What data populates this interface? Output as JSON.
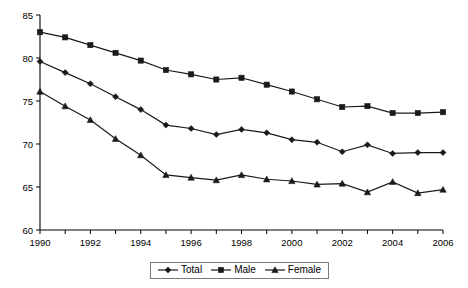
{
  "chart_data": {
    "type": "line",
    "title": "",
    "subtitle": "",
    "xlabel": "",
    "ylabel": "",
    "x": [
      1990,
      1991,
      1992,
      1993,
      1994,
      1995,
      1996,
      1997,
      1998,
      1999,
      2000,
      2001,
      2002,
      2003,
      2004,
      2005,
      2006
    ],
    "xticklabels": [
      "1990",
      "",
      "1992",
      "",
      "1994",
      "",
      "1996",
      "",
      "1998",
      "",
      "2000",
      "",
      "2002",
      "",
      "2004",
      "",
      "2006"
    ],
    "xtick_values": [
      1990,
      1991,
      1992,
      1993,
      1994,
      1995,
      1996,
      1997,
      1998,
      1999,
      2000,
      2001,
      2002,
      2003,
      2004,
      2005,
      2006
    ],
    "xlim": [
      1990,
      2006
    ],
    "yticklabels": [
      "60",
      "65",
      "70",
      "75",
      "80",
      "85"
    ],
    "ytick_values": [
      60,
      65,
      70,
      75,
      80,
      85
    ],
    "ylim": [
      60,
      85
    ],
    "grid": false,
    "legend_position": "bottom-center",
    "series": [
      {
        "name": "Total",
        "marker": "diamond",
        "color": "#1a1a1a",
        "values": [
          79.6,
          78.3,
          77.0,
          75.5,
          74.0,
          72.2,
          71.8,
          71.1,
          71.7,
          71.3,
          70.5,
          70.2,
          69.1,
          69.9,
          68.9,
          69.0,
          69.0
        ]
      },
      {
        "name": "Male",
        "marker": "square",
        "color": "#1a1a1a",
        "values": [
          83.0,
          82.4,
          81.5,
          80.6,
          79.7,
          78.6,
          78.1,
          77.5,
          77.7,
          76.9,
          76.1,
          75.2,
          74.3,
          74.4,
          73.6,
          73.6,
          73.7
        ]
      },
      {
        "name": "Female",
        "marker": "triangle",
        "color": "#1a1a1a",
        "values": [
          76.1,
          74.4,
          72.8,
          70.6,
          68.7,
          66.4,
          66.1,
          65.8,
          66.4,
          65.9,
          65.7,
          65.3,
          65.4,
          64.4,
          65.6,
          64.3,
          64.7
        ]
      }
    ]
  },
  "legend": {
    "items": [
      {
        "label": "Total",
        "marker": "diamond"
      },
      {
        "label": "Male",
        "marker": "square"
      },
      {
        "label": "Female",
        "marker": "triangle"
      }
    ]
  }
}
